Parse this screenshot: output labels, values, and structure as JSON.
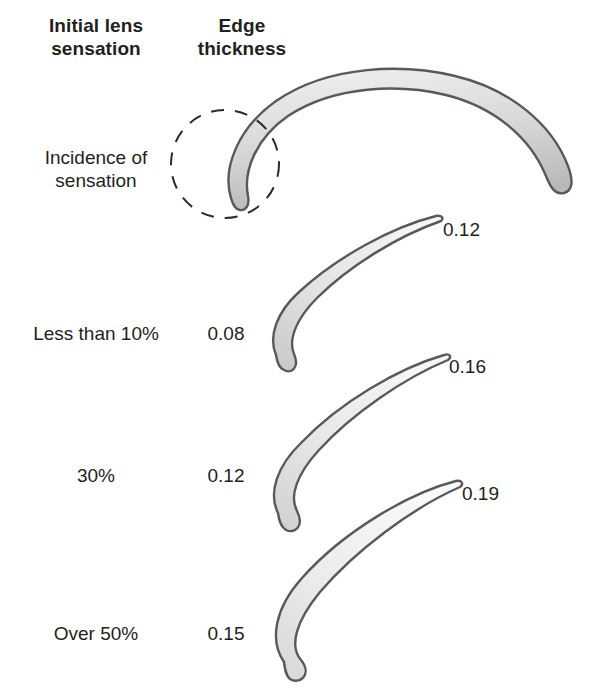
{
  "figure": {
    "columns": [
      {
        "header": "Initial lens\nsensation"
      },
      {
        "header": "Edge\nthickness"
      }
    ],
    "rows": [
      {
        "sensation": "Incidence of\nsensation",
        "edge_thickness": "",
        "outer_value": ""
      },
      {
        "sensation": "Less than 10%",
        "edge_thickness": "0.08",
        "outer_value": "0.12"
      },
      {
        "sensation": "30%",
        "edge_thickness": "0.12",
        "outer_value": "0.16"
      },
      {
        "sensation": "Over 50%",
        "edge_thickness": "0.15",
        "outer_value": "0.19"
      }
    ],
    "annotations": {
      "highlight_circle": "dashed-circle-highlight"
    },
    "colors": {
      "text": "#231f20",
      "lens_outline": "#58595b",
      "lens_fill_light": "#f4f4f4",
      "lens_fill_dark": "#c9c9c9",
      "dash_circle": "#2b2b2b",
      "background": "#ffffff"
    }
  }
}
